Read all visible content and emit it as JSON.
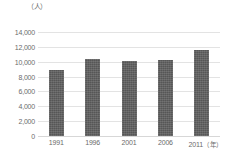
{
  "chart_data": {
    "type": "bar",
    "title": "",
    "subtitle": "",
    "xlabel": "（年）",
    "ylabel": "（人）",
    "categories": [
      "1991",
      "1996",
      "2001",
      "2006",
      "2011"
    ],
    "values": [
      8900,
      10400,
      10100,
      10200,
      11600
    ],
    "ylim": [
      0,
      14000
    ],
    "y_ticks": [
      0,
      2000,
      4000,
      6000,
      8000,
      10000,
      12000,
      14000
    ],
    "y_tick_labels": [
      "0",
      "2,000",
      "4,000",
      "6,000",
      "8,000",
      "10,000",
      "12,000",
      "14,000"
    ],
    "x_tick_labels": [
      "1991",
      "1996",
      "2001",
      "2006",
      "2011"
    ],
    "grid": true,
    "grid_axis": "y",
    "legend": false,
    "legend_position": "none",
    "bar_color": "#565656",
    "grid_color": "#e3e3e3",
    "text_color": "#6b6b6b",
    "background_color": "#ffffff",
    "series": [
      {
        "name": "",
        "values": [
          8900,
          10400,
          10100,
          10200,
          11600
        ]
      }
    ],
    "annotations": []
  },
  "axis": {
    "y_unit_label": "（人）",
    "x_unit_label": "（年）"
  }
}
